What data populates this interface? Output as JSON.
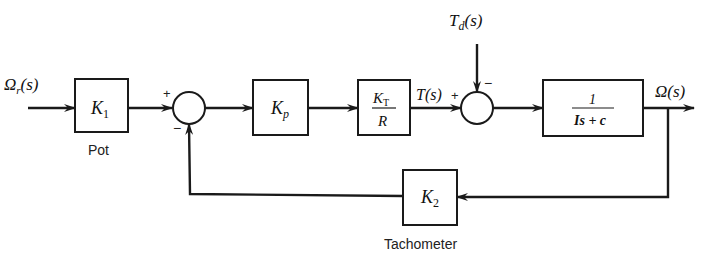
{
  "diagram": {
    "type": "block-diagram",
    "signals": {
      "input": {
        "base": "Ω",
        "sub": "r",
        "arg": "(s)"
      },
      "torque": {
        "base": "T",
        "arg": "(s)"
      },
      "disturbance": {
        "base": "T",
        "sub": "d",
        "arg": "(s)"
      },
      "output": {
        "base": "Ω",
        "arg": "(s)"
      }
    },
    "blocks": [
      {
        "id": "k1",
        "base": "K",
        "sub": "1",
        "caption": "Pot"
      },
      {
        "id": "kp",
        "base": "K",
        "sub": "p"
      },
      {
        "id": "kt_r",
        "num_base": "K",
        "num_sub": "T",
        "den": "R"
      },
      {
        "id": "plant",
        "num": "1",
        "den": "Is + c"
      },
      {
        "id": "k2",
        "base": "K",
        "sub": "2",
        "caption": "Tachometer"
      }
    ],
    "summing_junctions": [
      {
        "id": "sum1",
        "signs": {
          "left": "+",
          "bottom": "−"
        }
      },
      {
        "id": "sum2",
        "signs": {
          "left": "+",
          "top": "−"
        }
      }
    ]
  }
}
